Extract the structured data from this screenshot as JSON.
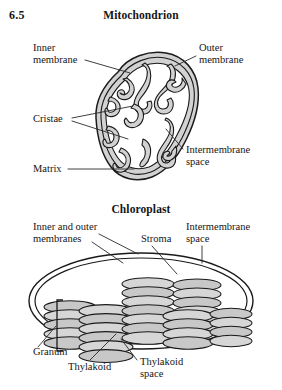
{
  "figure": {
    "number": "6.5"
  },
  "mitochondrion": {
    "title": "Mitochondrion",
    "labels": {
      "inner_membrane": "Inner\nmembrane",
      "outer_membrane": "Outer\nmembrane",
      "cristae": "Cristae",
      "matrix": "Matrix",
      "intermembrane_space": "Intermembrane\nspace"
    }
  },
  "chloroplast": {
    "title": "Chloroplast",
    "labels": {
      "inner_and_outer_membranes": "Inner and outer\nmembranes",
      "stroma": "Stroma",
      "intermembrane_space": "Intermembrane\nspace",
      "granum": "Granum",
      "thylakoid": "Thylakoid",
      "thylakoid_space": "Thylakoid\nspace"
    }
  },
  "style": {
    "membrane_fill": "#d2d2d2",
    "membrane_fill_light": "#e2e2e2",
    "stroke": "#1a1a1a",
    "matrix_fill": "#ffffff",
    "background": "#ffffff",
    "leader_color": "#2a2a2a"
  },
  "diagram_structure": {
    "mitochondrion_shape": "tilted-oblong-bean",
    "cristae_count": 11,
    "chloroplast_shape": "double-ellipse",
    "granum_stacks": 6,
    "thylakoids_per_stack": [
      5,
      6,
      7,
      6,
      7,
      4
    ]
  }
}
